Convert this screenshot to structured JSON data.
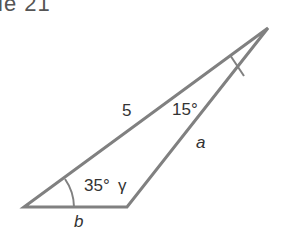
{
  "header": {
    "text": "le 21"
  },
  "diagram": {
    "type": "triangle",
    "vertices": {
      "bottom_left": [
        24,
        207
      ],
      "bottom_right": [
        127,
        207
      ],
      "apex": [
        268,
        28
      ]
    },
    "labels": {
      "side_left": "5",
      "side_right": "a",
      "side_bottom": "b",
      "angle_apex": "15°",
      "angle_bottom_left": "35°",
      "angle_bottom_right": "γ"
    },
    "colors": {
      "stroke": "#808080",
      "text": "#333333"
    }
  }
}
